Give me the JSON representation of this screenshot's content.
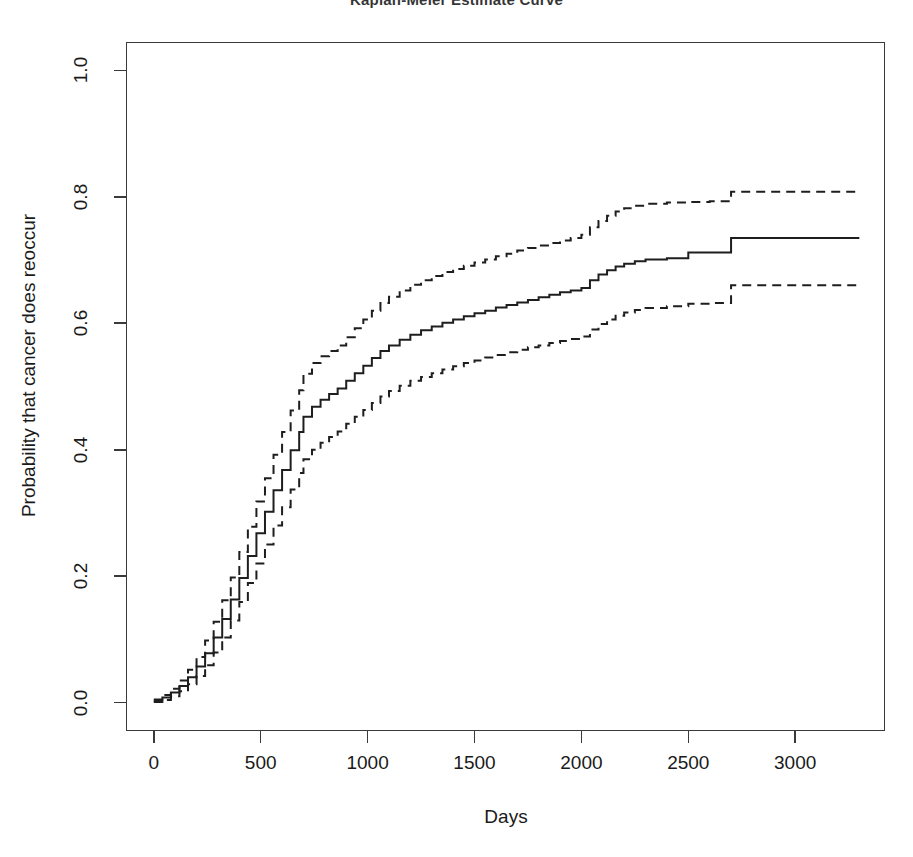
{
  "chart_data": {
    "type": "line",
    "title": "Kaplan-Meier Estimate Curve",
    "xlabel": "Days",
    "ylabel": "Probability that cancer does reoccur",
    "xlim": [
      -130,
      3420
    ],
    "ylim": [
      -0.045,
      1.045
    ],
    "xticks": [
      0,
      500,
      1000,
      1500,
      2000,
      2500,
      3000
    ],
    "xtick_labels": [
      "0",
      "500",
      "1000",
      "1500",
      "2000",
      "2500",
      "3000"
    ],
    "yticks": [
      0.0,
      0.2,
      0.4,
      0.6,
      0.8,
      1.0
    ],
    "ytick_labels": [
      "0.0",
      "0.2",
      "0.4",
      "0.6",
      "0.8",
      "1.0"
    ],
    "grid": false,
    "legend": "none",
    "frame": "box",
    "line_color": "#1e1e1e",
    "series": [
      {
        "name": "Upper 95% confidence band",
        "style": "dashed",
        "x": [
          0,
          40,
          80,
          120,
          160,
          200,
          240,
          280,
          320,
          360,
          400,
          440,
          480,
          520,
          560,
          600,
          640,
          680,
          700,
          740,
          780,
          820,
          860,
          900,
          940,
          980,
          1020,
          1060,
          1100,
          1150,
          1200,
          1250,
          1300,
          1350,
          1400,
          1450,
          1500,
          1550,
          1600,
          1650,
          1700,
          1750,
          1800,
          1850,
          1900,
          1950,
          2000,
          2040,
          2080,
          2120,
          2160,
          2200,
          2250,
          2300,
          2400,
          2500,
          2600,
          2690,
          2700,
          2900,
          3100,
          3300
        ],
        "y": [
          0.005,
          0.012,
          0.022,
          0.035,
          0.052,
          0.072,
          0.098,
          0.128,
          0.162,
          0.198,
          0.238,
          0.278,
          0.318,
          0.355,
          0.392,
          0.428,
          0.462,
          0.494,
          0.52,
          0.537,
          0.548,
          0.556,
          0.565,
          0.578,
          0.592,
          0.606,
          0.62,
          0.632,
          0.642,
          0.652,
          0.661,
          0.668,
          0.675,
          0.681,
          0.686,
          0.691,
          0.696,
          0.701,
          0.706,
          0.71,
          0.715,
          0.719,
          0.723,
          0.727,
          0.731,
          0.735,
          0.74,
          0.752,
          0.762,
          0.77,
          0.777,
          0.782,
          0.786,
          0.789,
          0.791,
          0.792,
          0.793,
          0.793,
          0.808,
          0.808,
          0.808,
          0.808
        ]
      },
      {
        "name": "Kaplan-Meier estimate",
        "style": "solid",
        "x": [
          0,
          40,
          80,
          120,
          160,
          200,
          240,
          280,
          320,
          360,
          400,
          440,
          480,
          520,
          560,
          600,
          640,
          680,
          700,
          740,
          780,
          820,
          860,
          900,
          940,
          980,
          1020,
          1060,
          1100,
          1150,
          1200,
          1250,
          1300,
          1350,
          1400,
          1450,
          1500,
          1550,
          1600,
          1650,
          1700,
          1750,
          1800,
          1850,
          1900,
          1950,
          2000,
          2040,
          2080,
          2120,
          2160,
          2200,
          2250,
          2300,
          2400,
          2500,
          2600,
          2690,
          2700,
          2900,
          3100,
          3300
        ],
        "y": [
          0.003,
          0.008,
          0.016,
          0.026,
          0.04,
          0.057,
          0.078,
          0.103,
          0.132,
          0.163,
          0.197,
          0.232,
          0.268,
          0.302,
          0.336,
          0.368,
          0.399,
          0.428,
          0.452,
          0.468,
          0.479,
          0.488,
          0.497,
          0.509,
          0.521,
          0.533,
          0.545,
          0.556,
          0.565,
          0.574,
          0.582,
          0.589,
          0.595,
          0.601,
          0.606,
          0.611,
          0.616,
          0.62,
          0.625,
          0.629,
          0.633,
          0.637,
          0.641,
          0.645,
          0.649,
          0.652,
          0.656,
          0.668,
          0.677,
          0.684,
          0.69,
          0.694,
          0.698,
          0.701,
          0.703,
          0.712,
          0.712,
          0.712,
          0.735,
          0.735,
          0.735,
          0.735
        ]
      },
      {
        "name": "Lower 95% confidence band",
        "style": "dashed",
        "x": [
          0,
          40,
          80,
          120,
          160,
          200,
          240,
          280,
          320,
          360,
          400,
          440,
          480,
          520,
          560,
          600,
          640,
          680,
          700,
          740,
          780,
          820,
          860,
          900,
          940,
          980,
          1020,
          1060,
          1100,
          1150,
          1200,
          1250,
          1300,
          1350,
          1400,
          1450,
          1500,
          1550,
          1600,
          1650,
          1700,
          1750,
          1800,
          1850,
          1900,
          1950,
          2000,
          2040,
          2080,
          2120,
          2160,
          2200,
          2250,
          2300,
          2400,
          2500,
          2600,
          2690,
          2700,
          2900,
          3100,
          3300
        ],
        "y": [
          0.001,
          0.004,
          0.01,
          0.018,
          0.029,
          0.042,
          0.059,
          0.079,
          0.103,
          0.13,
          0.159,
          0.189,
          0.22,
          0.25,
          0.28,
          0.309,
          0.337,
          0.363,
          0.385,
          0.4,
          0.411,
          0.42,
          0.429,
          0.441,
          0.452,
          0.463,
          0.474,
          0.484,
          0.493,
          0.501,
          0.509,
          0.515,
          0.521,
          0.527,
          0.532,
          0.537,
          0.541,
          0.546,
          0.55,
          0.554,
          0.558,
          0.562,
          0.565,
          0.569,
          0.572,
          0.575,
          0.579,
          0.59,
          0.599,
          0.606,
          0.612,
          0.617,
          0.621,
          0.624,
          0.627,
          0.631,
          0.632,
          0.632,
          0.66,
          0.66,
          0.66,
          0.66
        ]
      }
    ]
  }
}
